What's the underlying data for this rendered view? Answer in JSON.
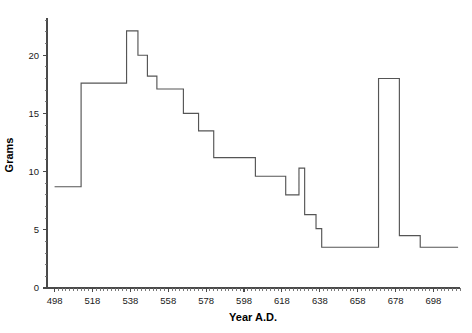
{
  "chart_data": {
    "type": "line",
    "subtype": "step",
    "title": "",
    "xlabel": "Year A.D.",
    "ylabel": "Grams",
    "xlim": [
      494,
      712
    ],
    "ylim": [
      0,
      23.2
    ],
    "grid": false,
    "legend": null,
    "x_ticks": [
      498,
      518,
      538,
      558,
      578,
      598,
      618,
      638,
      658,
      678,
      698
    ],
    "x_tick_labels": [
      "498",
      "518",
      "538",
      "558",
      "578",
      "598",
      "618",
      "638",
      "658",
      "678",
      "698"
    ],
    "x_minor_tick_interval": 2,
    "y_ticks": [
      0,
      5,
      10,
      15,
      20
    ],
    "y_tick_labels": [
      "0",
      "5",
      "10",
      "15",
      "20"
    ],
    "y_minor_tick_interval": 1,
    "series_name": "Coin weight standard",
    "line_color": "#555555",
    "steps": [
      {
        "start": 498,
        "end": 512,
        "value": 8.7
      },
      {
        "start": 512,
        "end": 536,
        "value": 17.6
      },
      {
        "start": 536,
        "end": 542,
        "value": 22.1
      },
      {
        "start": 542,
        "end": 547,
        "value": 20.0
      },
      {
        "start": 547,
        "end": 552,
        "value": 18.2
      },
      {
        "start": 552,
        "end": 566,
        "value": 17.1
      },
      {
        "start": 566,
        "end": 574,
        "value": 15.0
      },
      {
        "start": 574,
        "end": 582,
        "value": 13.5
      },
      {
        "start": 582,
        "end": 604,
        "value": 11.2
      },
      {
        "start": 604,
        "end": 620,
        "value": 9.6
      },
      {
        "start": 620,
        "end": 627,
        "value": 8.0
      },
      {
        "start": 627,
        "end": 630,
        "value": 10.3
      },
      {
        "start": 630,
        "end": 636,
        "value": 6.3
      },
      {
        "start": 636,
        "end": 639,
        "value": 5.1
      },
      {
        "start": 639,
        "end": 669,
        "value": 3.5
      },
      {
        "start": 669,
        "end": 680,
        "value": 18.0
      },
      {
        "start": 680,
        "end": 691,
        "value": 4.5
      },
      {
        "start": 691,
        "end": 711,
        "value": 3.5
      }
    ]
  },
  "axes": {
    "y_label": "Grams",
    "x_label": "Year A.D."
  }
}
